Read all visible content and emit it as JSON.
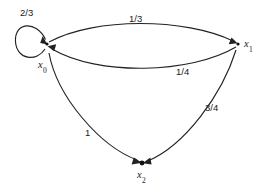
{
  "diagram": {
    "type": "directed-graph",
    "background_color": "#ffffff",
    "stroke_color": "#222222",
    "nodes": [
      {
        "id": "x0",
        "name": "x",
        "subscript": "0",
        "x": 47,
        "y": 44,
        "label_x": 38,
        "label_y": 60
      },
      {
        "id": "x1",
        "name": "x",
        "subscript": "1",
        "x": 238,
        "y": 44,
        "label_x": 244,
        "label_y": 39
      },
      {
        "id": "x2",
        "name": "x",
        "subscript": "2",
        "x": 142,
        "y": 163,
        "label_x": 137,
        "label_y": 170
      }
    ],
    "edges": [
      {
        "id": "e-x0-x0",
        "from": "x0",
        "to": "x0",
        "weight": "2/3",
        "label_x": 20,
        "label_y": 8,
        "kind": "self-loop"
      },
      {
        "id": "e-x0-x1",
        "from": "x0",
        "to": "x1",
        "weight": "1/3",
        "label_x": 129,
        "label_y": 14,
        "kind": "arc-upper"
      },
      {
        "id": "e-x1-x0",
        "from": "x1",
        "to": "x0",
        "weight": "1/4",
        "label_x": 176,
        "label_y": 67,
        "kind": "arc-lower"
      },
      {
        "id": "e-x1-x2",
        "from": "x1",
        "to": "x2",
        "weight": "3/4",
        "label_x": 205,
        "label_y": 103,
        "kind": "arc"
      },
      {
        "id": "e-x0-x2",
        "from": "x0",
        "to": "x2",
        "weight": "1",
        "label_x": 85,
        "label_y": 128,
        "kind": "arc"
      }
    ]
  }
}
